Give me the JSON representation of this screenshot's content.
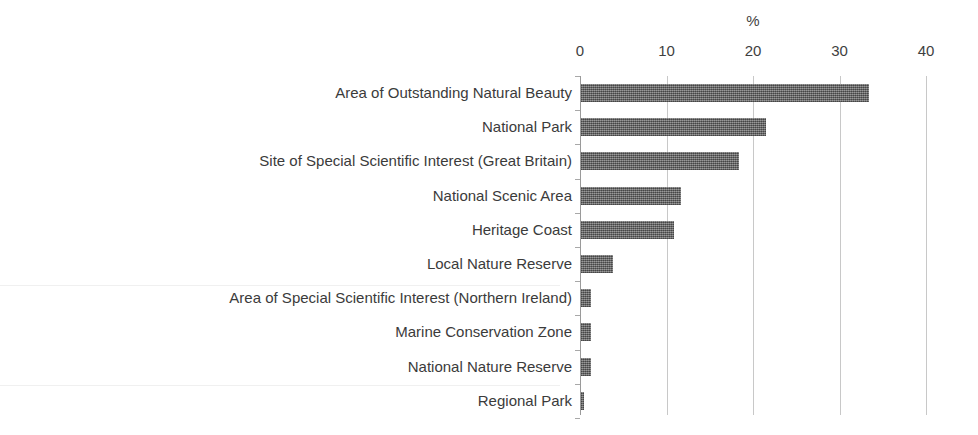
{
  "chart_data": {
    "type": "bar",
    "orientation": "horizontal",
    "title": "",
    "xlabel": "%",
    "ylabel": "",
    "xlim": [
      0,
      40
    ],
    "xticks": [
      0,
      10,
      20,
      30,
      40
    ],
    "grid": true,
    "legend": false,
    "bar_color": "#6e6e6e",
    "categories": [
      "Area of Outstanding Natural Beauty",
      "National Park",
      "Site of Special Scientific Interest (Great Britain)",
      "National Scenic Area",
      "Heritage Coast",
      "Local Nature Reserve",
      "Area of Special Scientific Interest (Northern Ireland)",
      "Marine Conservation Zone",
      "National Nature Reserve",
      "Regional Park"
    ],
    "values": [
      33.3,
      21.4,
      18.3,
      11.6,
      10.8,
      3.7,
      1.2,
      1.2,
      1.2,
      0.4
    ]
  }
}
